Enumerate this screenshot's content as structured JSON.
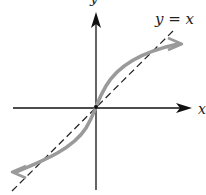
{
  "diagram": {
    "type": "function-graph",
    "axes": {
      "x_label": "x",
      "y_label": "y"
    },
    "reference_line": {
      "label": "y = x",
      "style": "dashed",
      "color": "#222222"
    },
    "curve": {
      "description": "odd increasing curve steeper than y = x at origin, flattening outward, arrows both ends",
      "color": "#9a9a9a"
    },
    "colors": {
      "axis": "#111111",
      "curve": "#9a9a9a",
      "dashed": "#222222"
    }
  }
}
